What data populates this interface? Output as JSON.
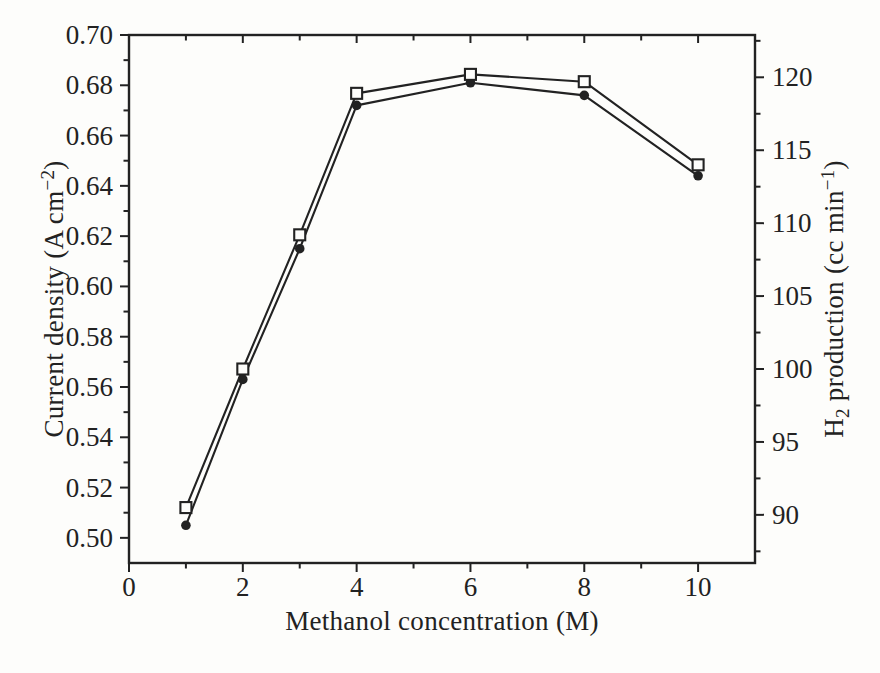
{
  "figure": {
    "background": "#fdfdfb",
    "ink_color": "#222222"
  },
  "chart_data": {
    "type": "line",
    "title": "",
    "grid": false,
    "legend": null,
    "x": [
      1,
      2,
      3,
      4,
      6,
      8,
      10
    ],
    "series": [
      {
        "name": "Current density",
        "axis": "left",
        "marker": "filled-circle",
        "color": "#222222",
        "values": [
          0.505,
          0.563,
          0.615,
          0.672,
          0.681,
          0.676,
          0.644
        ]
      },
      {
        "name": "H2 production",
        "axis": "right",
        "marker": "open-square",
        "color": "#222222",
        "values": [
          90.5,
          100,
          109.2,
          118.9,
          120.2,
          119.7,
          114
        ]
      }
    ],
    "xlabel": "Methanol concentration (M)",
    "ylabel_left": "Current density (A cm⁻²)",
    "ylabel_right": "H₂ production (cc min⁻¹)",
    "ylabel_left_parts": [
      {
        "t": "Current density (A cm"
      },
      {
        "t": "−2",
        "sup": true
      },
      {
        "t": ")"
      }
    ],
    "ylabel_right_parts": [
      {
        "t": "H"
      },
      {
        "t": "2",
        "sub": true
      },
      {
        "t": " production (cc min"
      },
      {
        "t": "−1",
        "sup": true
      },
      {
        "t": ")"
      }
    ],
    "x_axis": {
      "min": 0,
      "max": 11,
      "major_ticks": [
        0,
        2,
        4,
        6,
        8,
        10
      ],
      "minor_ticks": [
        1,
        3,
        5,
        7,
        9
      ],
      "labels": [
        "0",
        "2",
        "4",
        "6",
        "8",
        "10"
      ]
    },
    "left_axis": {
      "min": 0.49,
      "max": 0.7,
      "major_ticks": [
        0.5,
        0.52,
        0.54,
        0.56,
        0.58,
        0.6,
        0.62,
        0.64,
        0.66,
        0.68,
        0.7
      ],
      "minor_ticks": [
        0.51,
        0.53,
        0.55,
        0.57,
        0.59,
        0.61,
        0.63,
        0.65,
        0.67,
        0.69
      ],
      "labels": [
        "0.50",
        "0.52",
        "0.54",
        "0.56",
        "0.58",
        "0.60",
        "0.62",
        "0.64",
        "0.66",
        "0.68",
        "0.70"
      ]
    },
    "right_axis": {
      "min": 86.7,
      "max": 122.9,
      "major_ticks": [
        90,
        95,
        100,
        105,
        110,
        115,
        120
      ],
      "minor_ticks": [
        87.5,
        92.5,
        97.5,
        102.5,
        107.5,
        112.5,
        117.5,
        122.5
      ],
      "labels": [
        "90",
        "95",
        "100",
        "105",
        "110",
        "115",
        "120"
      ]
    }
  }
}
